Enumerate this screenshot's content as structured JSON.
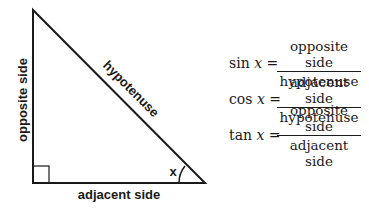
{
  "diagram": {
    "labels": {
      "opposite": "opposite side",
      "hypotenuse": "hypotenuse",
      "adjacent": "adjacent side",
      "angle": "x"
    },
    "line_color": "#1a1a1a"
  },
  "formulas": [
    {
      "fn": "sin",
      "var": "x",
      "eq": "=",
      "numerator": "opposite side",
      "denominator": "hypotenuse"
    },
    {
      "fn": "cos",
      "var": "x",
      "eq": "=",
      "numerator": "adjacent side",
      "denominator": "hypotenuse"
    },
    {
      "fn": "tan",
      "var": "x",
      "eq": "=",
      "numerator": "opposite side",
      "denominator": "adjacent side"
    }
  ]
}
